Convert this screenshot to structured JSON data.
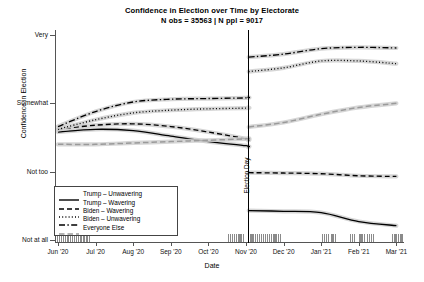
{
  "chart_data": {
    "type": "line",
    "title": "Confidence in Election over Time by Electorate",
    "subtitle": "N obs = 35563 | N ppl = 9017",
    "xlabel": "Date",
    "ylabel": "Confidence in Election",
    "x_ticklabels": [
      "Jun '20",
      "Jul '20",
      "Aug '20",
      "Sep '20",
      "Oct '20",
      "Nov '20",
      "Dec '20",
      "Jan '21",
      "Feb '21",
      "Mar '21"
    ],
    "y_ticklabels": [
      "Very",
      "Somewhat",
      "Not too",
      "Not at all"
    ],
    "y_values": [
      4,
      3,
      2,
      1
    ],
    "ylim": [
      1,
      4
    ],
    "grid": false,
    "legend_position": "lower-left",
    "annotation": "Election Day",
    "annotation_x": "Nov '20",
    "rug": "observation density marks along x-axis",
    "series": [
      {
        "name": "Trump – Unwavering",
        "style": "solid",
        "color": "#000000",
        "x": [
          "Jun '20",
          "Jul '20",
          "Aug '20",
          "Sep '20",
          "Oct '20",
          "Nov '20",
          "Election Day",
          "Dec '20",
          "Jan '21",
          "Feb '21",
          "Mar '21"
        ],
        "values": [
          2.58,
          2.62,
          2.6,
          2.52,
          2.44,
          2.38,
          2.36,
          1.42,
          1.4,
          1.27,
          1.21
        ]
      },
      {
        "name": "Trump – Wavering",
        "style": "dashed",
        "color": "#000000",
        "x": [
          "Jun '20",
          "Jul '20",
          "Aug '20",
          "Sep '20",
          "Oct '20",
          "Nov '20",
          "Election Day",
          "Dec '20",
          "Jan '21",
          "Feb '21",
          "Mar '21"
        ],
        "values": [
          2.62,
          2.68,
          2.7,
          2.66,
          2.58,
          2.48,
          2.46,
          1.98,
          1.97,
          1.94,
          1.93
        ]
      },
      {
        "name": "Biden – Wavering",
        "style": "dotted",
        "color": "#000000",
        "x": [
          "Jun '20",
          "Jul '20",
          "Aug '20",
          "Sep '20",
          "Oct '20",
          "Nov '20",
          "Election Day",
          "Dec '20",
          "Jan '21",
          "Feb '21",
          "Mar '21"
        ],
        "values": [
          2.62,
          2.76,
          2.86,
          2.9,
          2.92,
          2.93,
          2.94,
          3.52,
          3.62,
          3.62,
          3.58
        ]
      },
      {
        "name": "Biden – Unwavering",
        "style": "dashdot",
        "color": "#000000",
        "x": [
          "Jun '20",
          "Jul '20",
          "Aug '20",
          "Sep '20",
          "Oct '20",
          "Nov '20",
          "Election Day",
          "Dec '20",
          "Jan '21",
          "Feb '21",
          "Mar '21"
        ],
        "values": [
          2.66,
          2.88,
          3.02,
          3.06,
          3.07,
          3.08,
          3.09,
          3.72,
          3.8,
          3.82,
          3.81
        ]
      },
      {
        "name": "Everyone Else",
        "style": "dashed-gray",
        "color": "#9a9a9a",
        "x": [
          "Jun '20",
          "Jul '20",
          "Aug '20",
          "Sep '20",
          "Oct '20",
          "Nov '20",
          "Election Day",
          "Dec '20",
          "Jan '21",
          "Feb '21",
          "Mar '21"
        ],
        "values": [
          2.4,
          2.4,
          2.42,
          2.44,
          2.46,
          2.48,
          2.49,
          2.72,
          2.84,
          2.94,
          3.0
        ]
      }
    ]
  },
  "legend": {
    "items": [
      {
        "label": "Trump – Unwavering"
      },
      {
        "label": "Trump – Wavering"
      },
      {
        "label": "Biden – Wavering"
      },
      {
        "label": "Biden – Unwavering"
      },
      {
        "label": "Everyone Else"
      }
    ]
  }
}
